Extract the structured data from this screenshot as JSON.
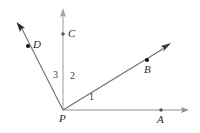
{
  "figure": {
    "background_color": "#ffffff",
    "line_color": "#8a8a8a",
    "ray_color": "#6e6e6e",
    "dot_color": "#1a1a1a",
    "label_color": "#2b2b2b",
    "width": 200,
    "height": 133
  },
  "vertex": {
    "name": "P",
    "label": "P",
    "x": 63,
    "y": 110,
    "label_x": 59,
    "label_y": 114
  },
  "points": [
    {
      "id": "A",
      "label": "A",
      "x": 161,
      "y": 110,
      "label_x": 157,
      "label_y": 114,
      "on_ray": "ray-PA"
    },
    {
      "id": "B",
      "label": "B",
      "x": 147,
      "y": 60,
      "label_x": 144,
      "label_y": 64,
      "on_ray": "ray-PB"
    },
    {
      "id": "C",
      "label": "C",
      "x": 63,
      "y": 34,
      "label_x": 68,
      "label_y": 29,
      "on_ray": "ray-PC"
    },
    {
      "id": "D",
      "label": "D",
      "x": 28,
      "y": 46,
      "label_x": 33,
      "label_y": 40,
      "on_ray": "ray-PD"
    }
  ],
  "rays": [
    {
      "id": "ray-PA",
      "from": "P",
      "through": "A",
      "tip_x": 188,
      "tip_y": 110,
      "direction": "right-horizontal",
      "arrow": true
    },
    {
      "id": "ray-PB",
      "from": "P",
      "through": "B",
      "tip_x": 170,
      "tip_y": 44,
      "direction": "upper-right",
      "arrow": true
    },
    {
      "id": "ray-PC",
      "from": "P",
      "through": "C",
      "tip_x": 63,
      "tip_y": 9,
      "direction": "up-vertical",
      "arrow": true
    },
    {
      "id": "ray-PD",
      "from": "P",
      "through": "D",
      "tip_x": 17,
      "tip_y": 23,
      "direction": "upper-left",
      "arrow": true
    }
  ],
  "angles": [
    {
      "id": "angle-1",
      "label": "1",
      "between": "ray-PA and ray-PB",
      "label_x": 89,
      "label_y": 93
    },
    {
      "id": "angle-2",
      "label": "2",
      "between": "ray-PB and ray-PC",
      "label_x": 70,
      "label_y": 72
    },
    {
      "id": "angle-3",
      "label": "3",
      "between": "ray-PC and ray-PD",
      "label_x": 53,
      "label_y": 71
    }
  ]
}
